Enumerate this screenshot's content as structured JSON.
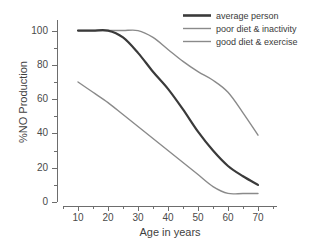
{
  "chart_data": {
    "type": "line",
    "title": "",
    "xlabel": "Age in years",
    "ylabel": "%NO Production",
    "xlim": [
      5,
      75
    ],
    "ylim": [
      0,
      105
    ],
    "xticks": [
      10,
      20,
      30,
      40,
      50,
      60,
      70
    ],
    "yticks": [
      0,
      20,
      40,
      60,
      80,
      100
    ],
    "grid": false,
    "legend_position": "top-right",
    "x": [
      10,
      15,
      20,
      25,
      30,
      35,
      40,
      45,
      50,
      55,
      60,
      65,
      70
    ],
    "series": [
      {
        "name": "average person",
        "color": "#3a3a3a",
        "width": 2.2,
        "values": [
          100,
          100,
          100,
          96,
          87,
          76,
          66,
          54,
          41,
          30,
          21,
          15,
          10
        ]
      },
      {
        "name": "poor diet & inactivity",
        "color": "#8a8a8a",
        "width": 1.4,
        "values": [
          70,
          64,
          58,
          51,
          44,
          37,
          30,
          23,
          16,
          9,
          5,
          5,
          5
        ]
      },
      {
        "name": "good diet & exercise",
        "color": "#8a8a8a",
        "width": 1.4,
        "values": [
          100,
          100,
          100,
          100,
          100,
          96,
          89,
          82,
          76,
          71,
          64,
          52,
          39
        ]
      }
    ]
  },
  "axes": {
    "y_title": "%NO Production",
    "x_title": "Age in years",
    "y_tick_labels": [
      "100",
      "80",
      "60",
      "40",
      "20",
      "0"
    ],
    "x_tick_labels": [
      "10",
      "20",
      "30",
      "40",
      "50",
      "60",
      "70"
    ]
  },
  "legend": {
    "items": [
      {
        "label": "average person",
        "color": "#3a3a3a",
        "thick": true
      },
      {
        "label": "poor diet & inactivity",
        "color": "#8a8a8a",
        "thick": false
      },
      {
        "label": "good diet & exercise",
        "color": "#8a8a8a",
        "thick": false
      }
    ]
  }
}
